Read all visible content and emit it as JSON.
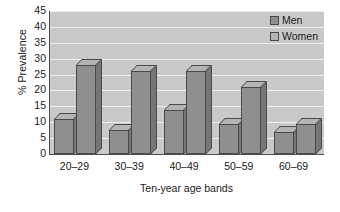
{
  "chart_data": {
    "type": "bar",
    "title": "",
    "subtitle": "",
    "xlabel": "Ten-year age bands",
    "ylabel": "% Prevalence",
    "categories": [
      "20–29",
      "30–39",
      "40–49",
      "50–59",
      "60–69"
    ],
    "series": [
      {
        "name": "Men",
        "values": [
          11,
          7.5,
          14,
          9.5,
          7
        ],
        "color": "#8f8f8f"
      },
      {
        "name": "Women",
        "values": [
          28,
          26,
          26,
          21,
          9.5
        ],
        "color": "#8f8f8f"
      }
    ],
    "ylim": [
      0,
      45
    ],
    "ytick_values": [
      0,
      5,
      10,
      15,
      20,
      25,
      30,
      35,
      40,
      45
    ],
    "ytick_labels": [
      "0",
      "5",
      "10",
      "15",
      "20",
      "25",
      "30",
      "35",
      "40",
      "45"
    ],
    "grid": true,
    "grid_axis": "y",
    "grid_color": "#efefef",
    "plot_background": "#c9c9c9",
    "figure_background": "#ffffff",
    "axis_color": "#4d4d4d",
    "legend_position": "top-right",
    "legend_entries": [
      "Men",
      "Women"
    ],
    "style": "3d-bar"
  },
  "legend": {
    "items": [
      {
        "label": "Men",
        "swatch_color": "#8f8f8f"
      },
      {
        "label": "Women",
        "swatch_color": "#b4b4b4"
      }
    ]
  }
}
